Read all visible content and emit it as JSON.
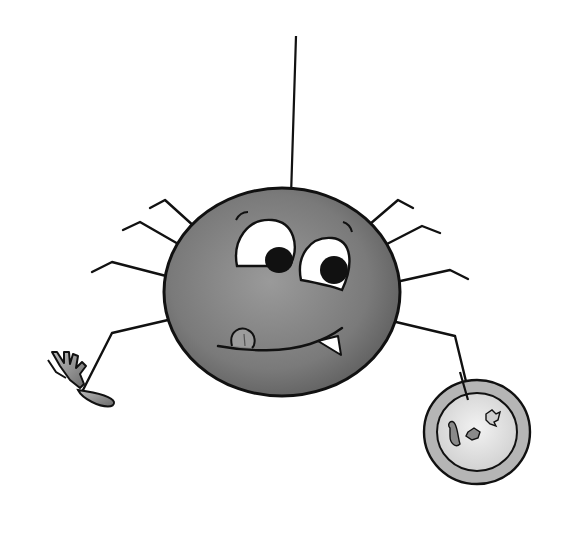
{
  "illustration": {
    "title": "Cartoon spider hanging from a thread holding a fork and a plate of crumbs",
    "subject": "spider",
    "expression": "hungry, licking lips with tongue out and one fang",
    "held_items": [
      "fork",
      "plate"
    ],
    "colors": {
      "body": "#7a7a7a",
      "body_highlight": "#9a9a9a",
      "outline": "#111111",
      "eye_white": "#ffffff",
      "pupil": "#111111",
      "tongue": "#9c9c9c",
      "fork": "#8e8e8e",
      "plate_rim": "#b5b5b5",
      "plate_center": "#e6e6e6",
      "crumbs": "#8a8a8a",
      "background": "#ffffff"
    }
  }
}
